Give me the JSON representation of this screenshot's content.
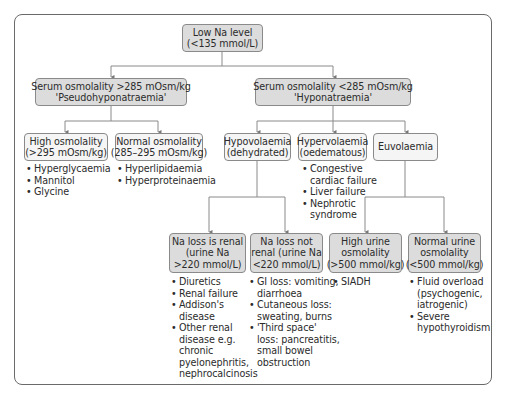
{
  "diagram": {
    "type": "flowchart",
    "root": {
      "label_line1": "Low Na level",
      "label_line2": "(<135 mmol/L)"
    },
    "serum_high": {
      "label_line1": "Serum osmolality >285 mOsm/kg",
      "label_line2": "'Pseudohyponatraemia'"
    },
    "serum_low": {
      "label_line1": "Serum osmolality <285 mOsm/kg",
      "label_line2": "'Hyponatraemia'"
    },
    "high_osm": {
      "label_line1": "High osmolality",
      "label_line2": "(>295 mOsm/kg)",
      "causes": [
        "Hyperglycaemia",
        "Mannitol",
        "Glycine"
      ]
    },
    "normal_osm": {
      "label_line1": "Normal osmolality",
      "label_line2": "(285–295 mOsm/kg)",
      "causes": [
        "Hyperlipidaemia",
        "Hyperproteinaemia"
      ]
    },
    "hypovol": {
      "label_line1": "Hypovolaemia",
      "label_line2": "(dehydrated)"
    },
    "hypervol": {
      "label_line1": "Hypervolaemia",
      "label_line2": "(oedematous)",
      "causes": [
        [
          "Congestive",
          "cardiac failure"
        ],
        [
          "Liver failure"
        ],
        [
          "Nephrotic",
          "syndrome"
        ]
      ]
    },
    "euvol": {
      "label_line1": "Euvolaemia"
    },
    "renal": {
      "label_line1": "Na loss is renal",
      "label_line2": "(urine Na",
      "label_line3": ">220 mmol/L)",
      "causes": [
        [
          "Diuretics"
        ],
        [
          "Renal failure"
        ],
        [
          "Addison's",
          "disease"
        ],
        [
          "Other renal",
          "disease e.g.",
          "chronic",
          "pyelonephritis,",
          "nephrocalcinosis"
        ]
      ]
    },
    "nonrenal": {
      "label_line1": "Na loss not",
      "label_line2": "renal (urine Na",
      "label_line3": "<220 mmol/L)",
      "causes": [
        [
          "GI loss: vomiting,",
          "diarrhoea"
        ],
        [
          "Cutaneous loss:",
          "sweating, burns"
        ],
        [
          "'Third space'",
          "loss: pancreatitis,",
          "small bowel",
          "obstruction"
        ]
      ]
    },
    "high_urine": {
      "label_line1": "High urine",
      "label_line2": "osmolality",
      "label_line3": "(>500 mmol/kg)",
      "causes": [
        [
          "SIADH"
        ]
      ]
    },
    "normal_urine": {
      "label_line1": "Normal urine",
      "label_line2": "osmolality",
      "label_line3": "(<500 mmol/kg)",
      "causes": [
        [
          "Fluid overload",
          "(psychogenic,",
          "iatrogenic)"
        ],
        [
          "Severe",
          "hypothyroidism"
        ]
      ]
    }
  },
  "colors": {
    "box_dark": "#dcdcdc",
    "box_light": "#f5f5f5",
    "line": "#8a8a8a",
    "frame": "#6a6a6a"
  }
}
